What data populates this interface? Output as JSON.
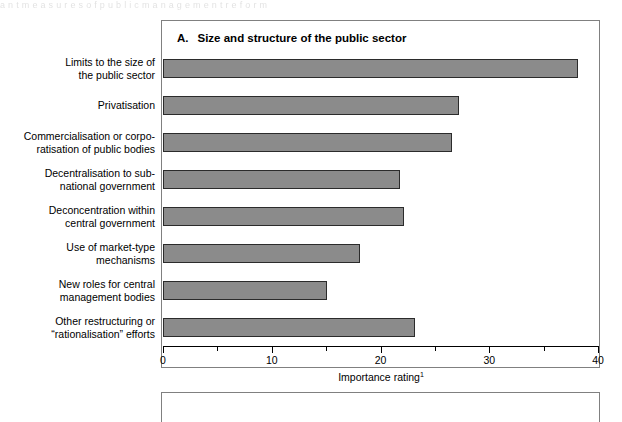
{
  "page": {
    "ghost_text_top": "a  n  t     m  e  a  s  u  r  e  s     o  f     p  u  b  l  i  c     m  a  n  a  g  e  m  e  n  t     r  e  f  o  r  m"
  },
  "panel": {
    "letter": "A.",
    "title": "Size and structure of the public sector"
  },
  "chart_data": {
    "type": "bar",
    "orientation": "horizontal",
    "xlabel": "Importance rating",
    "xlabel_superscript": "1",
    "ylabel": "",
    "xlim": [
      0,
      40
    ],
    "xticks": [
      0,
      10,
      20,
      30,
      40
    ],
    "xtick_labels": [
      "0",
      "10",
      "20",
      "30",
      "40"
    ],
    "xticks_minor": [
      5,
      15,
      25,
      35
    ],
    "grid": false,
    "legend": false,
    "bar_color": "#8b8b8b",
    "bar_edge_color": "#2b2b2b",
    "categories": [
      "Limits to the size of the public sector",
      "Privatisation",
      "Commercialisation or corporatisation of public bodies",
      "Decentralisation to sub-national government",
      "Deconcentration within central government",
      "Use of market-type mechanisms",
      "New roles for central management bodies",
      "Other restructuring or “rationalisation” efforts"
    ],
    "values": [
      38.2,
      27.2,
      26.6,
      21.8,
      22.2,
      18.1,
      15.1,
      23.2
    ]
  },
  "categories_display": [
    {
      "line1": "Limits to the size of",
      "line2": "the public sector"
    },
    {
      "line1": "Privatisation",
      "line2": ""
    },
    {
      "line1": "Commercialisation or corpo-",
      "line2": "ratisation of public bodies"
    },
    {
      "line1": "Decentralisation to sub-",
      "line2": "national government"
    },
    {
      "line1": "Deconcentration within",
      "line2": "central government"
    },
    {
      "line1": "Use of market-type",
      "line2": "mechanisms"
    },
    {
      "line1": "New roles for central",
      "line2": "management bodies"
    },
    {
      "line1": "Other restructuring or",
      "line2": "“rationalisation” efforts"
    }
  ]
}
